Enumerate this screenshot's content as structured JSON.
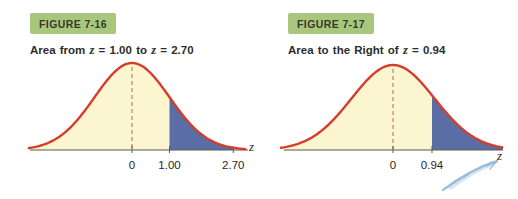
{
  "page": {
    "background": "#ffffff"
  },
  "colors": {
    "curve_red": "#d63c2b",
    "fill_yellow": "#fbf6cf",
    "fill_blue": "#5a6da4",
    "dash_line": "#c08061",
    "axis": "#5c5c4e",
    "label_box_green": "#a9c77c",
    "label_text": "#39392d",
    "caption_text": "#2d2d2d",
    "feather_blue": "#8fb6dc"
  },
  "chart_data": [
    {
      "type": "area",
      "figure_label": "FIGURE 7-16",
      "caption": {
        "pre": "Area from",
        "z1": "z",
        "eq1": "=",
        "val1": "1.00",
        "mid": "to",
        "z2": "z",
        "eq2": "=",
        "val2": "2.70"
      },
      "distribution": "standard normal curve",
      "mean_line_z": 0,
      "x_axis_label": "z",
      "x_range_z": [
        -2.9,
        3.1
      ],
      "ticks": [
        {
          "z": 0,
          "label": "0"
        },
        {
          "z": 1.0,
          "label": "1.00"
        },
        {
          "z": 2.7,
          "label": "2.70"
        }
      ],
      "shaded_regions": [
        {
          "from_z": -2.9,
          "to_z": 1.0,
          "color_key": "fill_yellow"
        },
        {
          "from_z": 1.0,
          "to_z": 2.7,
          "color_key": "fill_blue"
        }
      ]
    },
    {
      "type": "area",
      "figure_label": "FIGURE 7-17",
      "caption": {
        "pre": "Area to the Right of",
        "z1": "z",
        "eq1": "=",
        "val1": "0.94"
      },
      "distribution": "standard normal curve",
      "mean_line_z": 0,
      "x_axis_label": "z",
      "x_range_z": [
        -2.7,
        2.65
      ],
      "ticks": [
        {
          "z": 0,
          "label": "0"
        },
        {
          "z": 0.94,
          "label": "0.94"
        }
      ],
      "shaded_regions": [
        {
          "from_z": -2.7,
          "to_z": 0.94,
          "color_key": "fill_yellow"
        },
        {
          "from_z": 0.94,
          "to_z": 2.65,
          "color_key": "fill_blue"
        }
      ]
    }
  ],
  "decorations": {
    "corner_icon": "feather-swoosh-icon"
  }
}
